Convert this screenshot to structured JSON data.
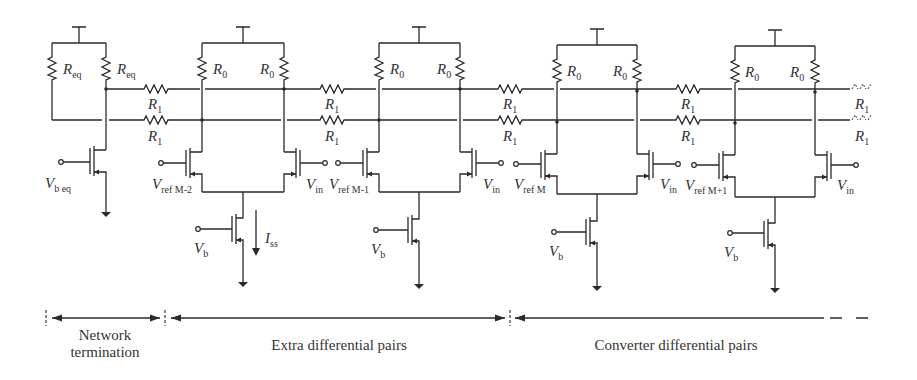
{
  "diagram": {
    "type": "circuit-schematic",
    "termination": {
      "resistors": [
        {
          "label": "R",
          "sub": "eq"
        },
        {
          "label": "R",
          "sub": "eq"
        }
      ],
      "bias_input": {
        "label": "V",
        "sub": "b eq"
      }
    },
    "stages": [
      {
        "id": "pair-1",
        "load_left": {
          "label": "R",
          "sub": "0"
        },
        "load_right": {
          "label": "R",
          "sub": "0"
        },
        "ref": {
          "label": "V",
          "sub": "ref M-2"
        },
        "in": {
          "label": "V",
          "sub": "in"
        },
        "bias": {
          "label": "V",
          "sub": "b"
        },
        "tail_current": {
          "label": "I",
          "sub": "ss"
        }
      },
      {
        "id": "pair-2",
        "load_left": {
          "label": "R",
          "sub": "0"
        },
        "load_right": {
          "label": "R",
          "sub": "0"
        },
        "ref": {
          "label": "V",
          "sub": "ref M-1"
        },
        "in": {
          "label": "V",
          "sub": "in"
        },
        "bias": {
          "label": "V",
          "sub": "b"
        }
      },
      {
        "id": "pair-3",
        "load_left": {
          "label": "R",
          "sub": "0"
        },
        "load_right": {
          "label": "R",
          "sub": "0"
        },
        "ref": {
          "label": "V",
          "sub": "ref M"
        },
        "in": {
          "label": "V",
          "sub": "in"
        },
        "bias": {
          "label": "V",
          "sub": "b"
        }
      },
      {
        "id": "pair-4",
        "load_left": {
          "label": "R",
          "sub": "0"
        },
        "load_right": {
          "label": "R",
          "sub": "0"
        },
        "ref": {
          "label": "V",
          "sub": "ref M+1"
        },
        "in": {
          "label": "V",
          "sub": "in"
        },
        "bias": {
          "label": "V",
          "sub": "b"
        }
      }
    ],
    "interpolation_resistor": {
      "label": "R",
      "sub": "1"
    },
    "sections": [
      {
        "label_line1": "Network",
        "label_line2": "termination"
      },
      {
        "label_line1": "Extra differential pairs"
      },
      {
        "label_line1": "Converter differential pairs"
      }
    ]
  }
}
